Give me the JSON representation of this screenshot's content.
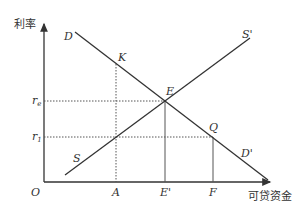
{
  "axes": {
    "y_label": "利率",
    "x_label": "可贷资金",
    "origin": "O"
  },
  "curves": {
    "demand": {
      "start_label": "D",
      "end_label": "D'"
    },
    "supply": {
      "start_label": "S",
      "end_label": "S'"
    }
  },
  "points": {
    "K": "K",
    "E": "E",
    "Q": "Q"
  },
  "y_ticks": {
    "re": {
      "base": "r",
      "sub": "e"
    },
    "r1": {
      "base": "r",
      "sub": "1"
    }
  },
  "x_ticks": {
    "A": "A",
    "E_prime": "E'",
    "F": "F"
  },
  "colors": {
    "line": "#333333",
    "dotted": "#555555"
  }
}
